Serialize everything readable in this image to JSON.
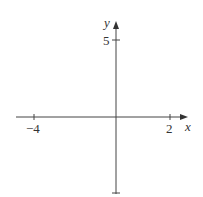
{
  "diagram": {
    "type": "cartesian-axes",
    "axes": {
      "x_label": "x",
      "y_label": "y"
    },
    "ticks": {
      "x": [
        {
          "value": -4,
          "label": "−4",
          "px": 34
        },
        {
          "value": 2,
          "label": "2",
          "px": 170
        }
      ],
      "y": [
        {
          "value": 5,
          "label": "5",
          "py": 40
        },
        {
          "value": null,
          "label": "",
          "py": 193
        }
      ]
    },
    "origin_px": {
      "x": 116,
      "y": 117
    },
    "colors": {
      "axis": "#444444",
      "text": "#333333",
      "background": "#ffffff"
    }
  }
}
